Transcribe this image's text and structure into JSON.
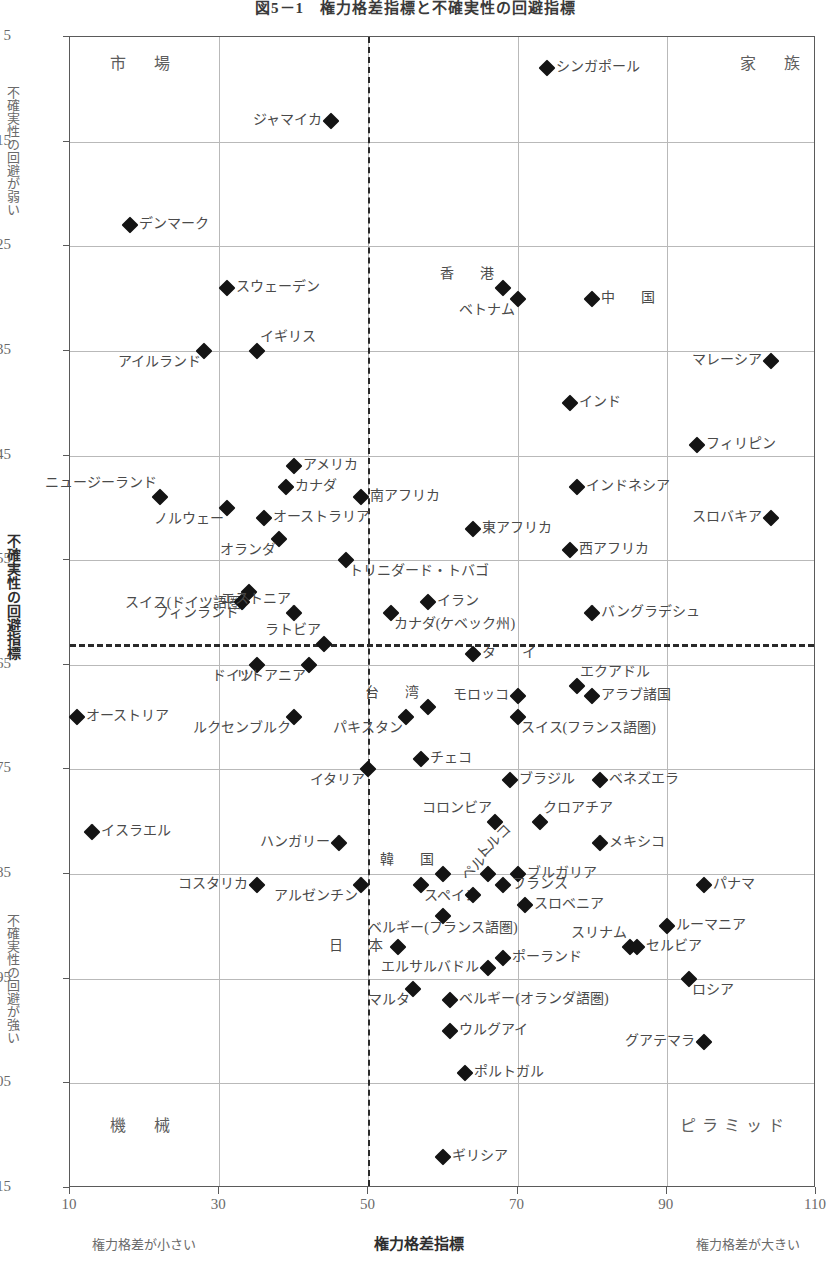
{
  "title": "図5－1　権力格差指標と不確実性の回避指標",
  "axes": {
    "y_title": "不確実性の回避指標",
    "y_top_note": "不確実性の回避が弱い",
    "y_bottom_note": "不確実性の回避が強い",
    "x_title": "権力格差指標",
    "x_left_note": "権力格差が小さい",
    "x_right_note": "権力格差が大きい",
    "y_ticks": [
      5,
      15,
      25,
      35,
      45,
      55,
      65,
      75,
      85,
      95,
      105,
      115
    ],
    "x_ticks": [
      10,
      30,
      50,
      70,
      90,
      110
    ]
  },
  "quadrants": {
    "top_left": "市　場",
    "top_right": "家　族",
    "bottom_left": "機　械",
    "bottom_right": "ピラミッド"
  },
  "chart_data": {
    "type": "scatter",
    "title": "図5－1　権力格差指標と不確実性の回避指標",
    "xlabel": "権力格差指標",
    "ylabel": "不確実性の回避指標",
    "xlim": [
      10,
      110
    ],
    "ylim": [
      5,
      115
    ],
    "y_inverted": true,
    "grid": true,
    "median_x": 50,
    "median_y": 63,
    "points": [
      {
        "label": "シンガポール",
        "x": 74,
        "y": 8,
        "pos": "r"
      },
      {
        "label": "ジャマイカ",
        "x": 45,
        "y": 13,
        "pos": "l"
      },
      {
        "label": "デンマーク",
        "x": 18,
        "y": 23,
        "pos": "r"
      },
      {
        "label": "スウェーデン",
        "x": 31,
        "y": 29,
        "pos": "r"
      },
      {
        "label": "香　港",
        "x": 68,
        "y": 29,
        "pos": "tl"
      },
      {
        "label": "ベトナム",
        "x": 70,
        "y": 30,
        "pos": "bl"
      },
      {
        "label": "中　国",
        "x": 80,
        "y": 30,
        "pos": "r"
      },
      {
        "label": "アイルランド",
        "x": 28,
        "y": 35,
        "pos": "bl"
      },
      {
        "label": "イギリス",
        "x": 35,
        "y": 35,
        "pos": "tr"
      },
      {
        "label": "マレーシア",
        "x": 104,
        "y": 36,
        "pos": "l"
      },
      {
        "label": "インド",
        "x": 77,
        "y": 40,
        "pos": "r"
      },
      {
        "label": "フィリピン",
        "x": 94,
        "y": 44,
        "pos": "r"
      },
      {
        "label": "アメリカ",
        "x": 40,
        "y": 46,
        "pos": "r"
      },
      {
        "label": "ニュージーランド",
        "x": 22,
        "y": 49,
        "pos": "tl"
      },
      {
        "label": "カナダ",
        "x": 39,
        "y": 48,
        "pos": "r"
      },
      {
        "label": "南アフリカ",
        "x": 49,
        "y": 49,
        "pos": "r"
      },
      {
        "label": "インドネシア",
        "x": 78,
        "y": 48,
        "pos": "r"
      },
      {
        "label": "ノルウェー",
        "x": 31,
        "y": 50,
        "pos": "bl"
      },
      {
        "label": "オーストラリア",
        "x": 36,
        "y": 51,
        "pos": "r"
      },
      {
        "label": "スロバキア",
        "x": 104,
        "y": 51,
        "pos": "l"
      },
      {
        "label": "東アフリカ",
        "x": 64,
        "y": 52,
        "pos": "r"
      },
      {
        "label": "オランダ",
        "x": 38,
        "y": 53,
        "pos": "bl"
      },
      {
        "label": "西アフリカ",
        "x": 77,
        "y": 54,
        "pos": "r"
      },
      {
        "label": "トリニダード・トバゴ",
        "x": 47,
        "y": 55,
        "pos": "br"
      },
      {
        "label": "スイス(ドイツ語圏)",
        "x": 34,
        "y": 58,
        "pos": "bl"
      },
      {
        "label": "フィンランド",
        "x": 33,
        "y": 59,
        "pos": "bl"
      },
      {
        "label": "エストニア",
        "x": 40,
        "y": 60,
        "pos": "tl"
      },
      {
        "label": "イラン",
        "x": 58,
        "y": 59,
        "pos": "r"
      },
      {
        "label": "カナダ(ケベック州)",
        "x": 53,
        "y": 60,
        "pos": "br"
      },
      {
        "label": "バングラデシュ",
        "x": 80,
        "y": 60,
        "pos": "r"
      },
      {
        "label": "ラトビア",
        "x": 44,
        "y": 63,
        "pos": "tl"
      },
      {
        "label": "ドイツ",
        "x": 35,
        "y": 65,
        "pos": "bl"
      },
      {
        "label": "リトアニア",
        "x": 42,
        "y": 65,
        "pos": "bl"
      },
      {
        "label": "タ　イ",
        "x": 64,
        "y": 64,
        "pos": "r"
      },
      {
        "label": "エクアドル",
        "x": 78,
        "y": 67,
        "pos": "tr"
      },
      {
        "label": "台　湾",
        "x": 58,
        "y": 69,
        "pos": "tl"
      },
      {
        "label": "モロッコ",
        "x": 70,
        "y": 68,
        "pos": "l"
      },
      {
        "label": "アラブ諸国",
        "x": 80,
        "y": 68,
        "pos": "r"
      },
      {
        "label": "オーストリア",
        "x": 11,
        "y": 70,
        "pos": "r"
      },
      {
        "label": "ルクセンブルク",
        "x": 40,
        "y": 70,
        "pos": "bl"
      },
      {
        "label": "パキスタン",
        "x": 55,
        "y": 70,
        "pos": "bl"
      },
      {
        "label": "スイス(フランス語圏)",
        "x": 70,
        "y": 70,
        "pos": "br"
      },
      {
        "label": "チェコ",
        "x": 57,
        "y": 74,
        "pos": "r"
      },
      {
        "label": "イタリア",
        "x": 50,
        "y": 75,
        "pos": "bl"
      },
      {
        "label": "ブラジル",
        "x": 69,
        "y": 76,
        "pos": "r"
      },
      {
        "label": "ベネズエラ",
        "x": 81,
        "y": 76,
        "pos": "r"
      },
      {
        "label": "コロンビア",
        "x": 67,
        "y": 80,
        "pos": "tl"
      },
      {
        "label": "クロアチア",
        "x": 73,
        "y": 80,
        "pos": "tr"
      },
      {
        "label": "イスラエル",
        "x": 13,
        "y": 81,
        "pos": "r"
      },
      {
        "label": "メキシコ",
        "x": 81,
        "y": 82,
        "pos": "r"
      },
      {
        "label": "ハンガリー",
        "x": 46,
        "y": 82,
        "pos": "l"
      },
      {
        "label": "韓　国",
        "x": 60,
        "y": 85,
        "pos": "tl"
      },
      {
        "label": "トルコ",
        "x": 66,
        "y": 85,
        "pos": "rot"
      },
      {
        "label": "ブルガリア",
        "x": 70,
        "y": 85,
        "pos": "r"
      },
      {
        "label": "コスタリカ",
        "x": 35,
        "y": 86,
        "pos": "l"
      },
      {
        "label": "アルゼンチン",
        "x": 49,
        "y": 86,
        "pos": "bl"
      },
      {
        "label": "スペイン",
        "x": 57,
        "y": 86,
        "pos": "br"
      },
      {
        "label": "フランス",
        "x": 68,
        "y": 86,
        "pos": "r"
      },
      {
        "label": "パナマ",
        "x": 95,
        "y": 86,
        "pos": "r"
      },
      {
        "label": "ペルー",
        "x": 64,
        "y": 87,
        "pos": "rot"
      },
      {
        "label": "スロベニア",
        "x": 71,
        "y": 88,
        "pos": "r"
      },
      {
        "label": "ベルギー(フランス語圏)",
        "x": 60,
        "y": 89,
        "pos": "bc"
      },
      {
        "label": "ルーマニア",
        "x": 90,
        "y": 90,
        "pos": "r"
      },
      {
        "label": "スリナム",
        "x": 85,
        "y": 92,
        "pos": "tl"
      },
      {
        "label": "セルビア",
        "x": 86,
        "y": 92,
        "pos": "r"
      },
      {
        "label": "日　本",
        "x": 54,
        "y": 92,
        "pos": "l"
      },
      {
        "label": "エルサルバドル",
        "x": 66,
        "y": 94,
        "pos": "l"
      },
      {
        "label": "ポーランド",
        "x": 68,
        "y": 93,
        "pos": "r"
      },
      {
        "label": "ロシア",
        "x": 93,
        "y": 95,
        "pos": "br"
      },
      {
        "label": "マルタ",
        "x": 56,
        "y": 96,
        "pos": "bl"
      },
      {
        "label": "ベルギー(オランダ語圏)",
        "x": 61,
        "y": 97,
        "pos": "r"
      },
      {
        "label": "グアテマラ",
        "x": 95,
        "y": 101,
        "pos": "l"
      },
      {
        "label": "ウルグアイ",
        "x": 61,
        "y": 100,
        "pos": "r"
      },
      {
        "label": "ポルトガル",
        "x": 63,
        "y": 104,
        "pos": "r"
      },
      {
        "label": "ギリシア",
        "x": 60,
        "y": 112,
        "pos": "r"
      }
    ]
  }
}
